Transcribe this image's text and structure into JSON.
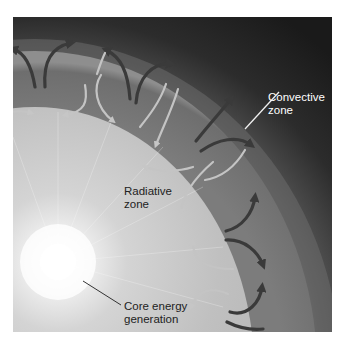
{
  "figure": {
    "colors": {
      "space_dark": "#1e1e1e",
      "corona": "#8a8a8a",
      "convective_zone": "#7a7a7a",
      "radiative_zone": "#bdbdbd",
      "core_glow": "#ffffff",
      "arrow_dark": "#3a3a3a",
      "arrow_light": "#c8c8c8",
      "label_dark_bg_text": "#ffffff",
      "label_light_bg_text": "#222222"
    }
  },
  "labels": {
    "convective": {
      "line1": "Convective",
      "line2": "zone"
    },
    "radiative": {
      "line1": "Radiative",
      "line2": "zone"
    },
    "core": {
      "line1": "Core energy",
      "line2": "generation"
    }
  }
}
